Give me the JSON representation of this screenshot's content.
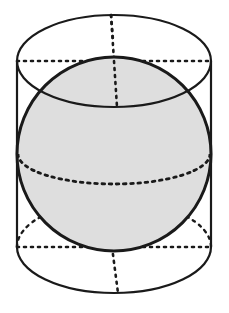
{
  "figure": {
    "title": "Sphere inscribed in a cylinder",
    "canvas": {
      "width": 229,
      "height": 313,
      "background": "#ffffff"
    },
    "colors": {
      "stroke": "#1a1a1a",
      "sphere_fill": "#dedede",
      "cylinder_fill": "#ffffff",
      "hidden_line": "#1a1a1a"
    },
    "cylinder": {
      "label": "cylinder",
      "left_wall_x": 17,
      "right_wall_x": 211,
      "top_ellipse": {
        "label": "cylinder-top-ellipse",
        "cx": 114,
        "cy": 61,
        "rx": 97,
        "ry": 46,
        "front_arc_style": "solid",
        "back_arc_style": "solid"
      },
      "bottom_ellipse": {
        "label": "cylinder-bottom-ellipse",
        "cx": 114,
        "cy": 247,
        "rx": 97,
        "ry": 46,
        "front_arc_style": "solid",
        "back_arc_style": "dotted"
      },
      "height": 186,
      "diameter": 194
    },
    "sphere": {
      "label": "inscribed-sphere",
      "cx": 114,
      "cy": 154,
      "r": 97,
      "fill": "#dedede",
      "outline_style": "solid",
      "equator": {
        "label": "sphere-equator",
        "cx": 114,
        "cy": 154,
        "rx": 97,
        "ry": 30,
        "visible_half": "back",
        "style": "dotted"
      }
    },
    "hidden_lines": [
      {
        "name": "top-ellipse-major-axis",
        "x1": 17,
        "y1": 61,
        "x2": 211,
        "y2": 61,
        "style": "dotted"
      },
      {
        "name": "top-ellipse-minor-axis",
        "x1": 111,
        "y1": 15,
        "x2": 117,
        "y2": 107,
        "style": "dotted"
      },
      {
        "name": "bottom-ellipse-major-axis",
        "x1": 17,
        "y1": 247,
        "x2": 211,
        "y2": 247,
        "style": "dotted"
      },
      {
        "name": "bottom-ellipse-minor-axis",
        "x1": 112,
        "y1": 247,
        "x2": 118,
        "y2": 293,
        "style": "dotted"
      }
    ],
    "stroke_widths": {
      "cylinder_outline": 2.2,
      "sphere_outline": 3.0,
      "dotted": 2.6
    },
    "dash_patterns": {
      "axis": "2 5",
      "equator": "2.6 4.6",
      "back_arc": "2.6 5"
    }
  }
}
